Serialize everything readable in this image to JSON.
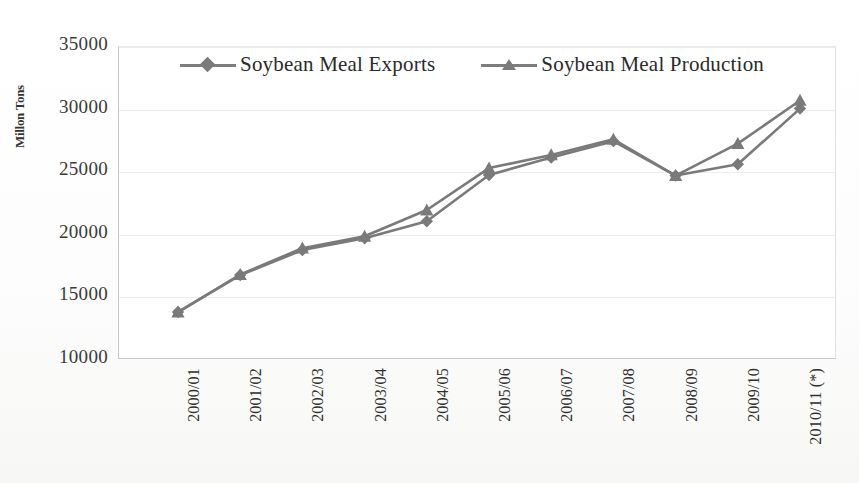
{
  "chart_data": {
    "type": "line",
    "title": "",
    "xlabel": "",
    "ylabel": "Millon Tons",
    "ylim": [
      10000,
      35000
    ],
    "ytick_values": [
      35000,
      30000,
      25000,
      20000,
      15000,
      10000
    ],
    "ytick_labels": [
      "35000",
      "30000",
      "25000",
      "20000",
      "15000",
      "10000"
    ],
    "grid": true,
    "legend_position": "top-center",
    "categories": [
      "2000/01",
      "2001/02",
      "2002/03",
      "2003/04",
      "2004/05",
      "2005/06",
      "2006/07",
      "2007/08",
      "2008/09",
      "2009/10",
      "2010/11 (*)"
    ],
    "series": [
      {
        "name": "Soybean Meal Exports",
        "marker": "diamond",
        "color": "#7a7a7a",
        "values": [
          13750,
          16700,
          18700,
          19650,
          21000,
          24700,
          26100,
          27400,
          24650,
          25550,
          30000
        ]
      },
      {
        "name": "Soybean Meal Production",
        "marker": "triangle",
        "color": "#7a7a7a",
        "values": [
          13750,
          16750,
          18850,
          19800,
          21900,
          25250,
          26300,
          27550,
          24650,
          27200,
          30650
        ]
      }
    ]
  },
  "legend": {
    "entries": [
      {
        "label": "Soybean Meal Exports",
        "marker": "diamond-marker-icon"
      },
      {
        "label": "Soybean Meal Production",
        "marker": "triangle-marker-icon"
      }
    ]
  },
  "axis": {
    "y_title": "Millon Tons"
  },
  "footer": {
    "watermark": ""
  }
}
